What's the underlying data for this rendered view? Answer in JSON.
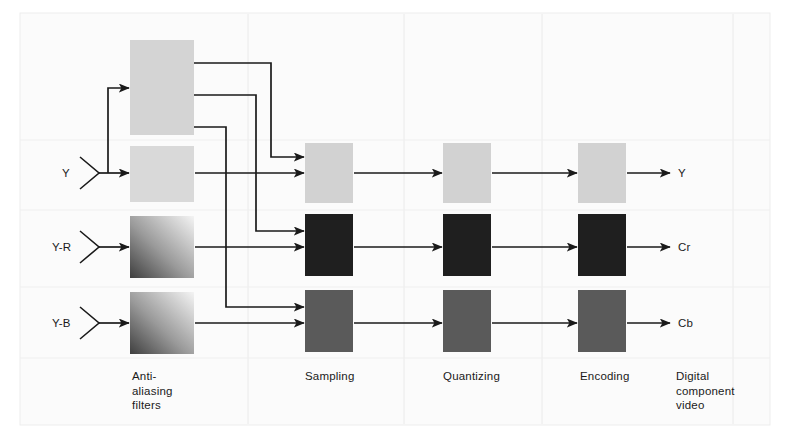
{
  "figure": {
    "background": "#ffffff",
    "panel_color": "#fbfbfb",
    "panel_border": "#ededed",
    "separator_color": "#eaeaea",
    "line_color": "#1a1a1a",
    "text_color": "#1a1a1a"
  },
  "inputs": [
    {
      "label": "Y",
      "x": 62,
      "y": 166
    },
    {
      "label": "Y-R",
      "x": 52,
      "y": 240
    },
    {
      "label": "Y-B",
      "x": 52,
      "y": 316
    }
  ],
  "outputs": [
    {
      "label": "Y",
      "x": 678,
      "y": 166
    },
    {
      "label": "Cr",
      "x": 678,
      "y": 240
    },
    {
      "label": "Cb",
      "x": 678,
      "y": 316
    }
  ],
  "columns": [
    {
      "name": "anti-aliasing-filters",
      "label": "Anti-\naliasing\nfilters",
      "x": 132,
      "y": 369
    },
    {
      "name": "sampling",
      "label": "Sampling",
      "x": 305,
      "y": 369
    },
    {
      "name": "quantizing",
      "label": "Quantizing",
      "x": 443,
      "y": 369
    },
    {
      "name": "encoding",
      "label": "Encoding",
      "x": 580,
      "y": 369
    },
    {
      "name": "digital-component-video",
      "label": "Digital\ncomponent\nvideo",
      "x": 676,
      "y": 369
    }
  ],
  "swatches": {
    "luma": "#d2d2d2",
    "chroma_r": "#1f1f1f",
    "chroma_b": "#5a5a5a",
    "gradient_dark": "#4a4a4a",
    "gradient_light": "#f2f2f2",
    "top_box": "#d4d4d4"
  },
  "blocks": [
    {
      "name": "filter-block-y-prefilter",
      "column": "anti-aliasing-filters",
      "row": "prefilter",
      "x": 130,
      "y": 40,
      "w": 64,
      "h": 95,
      "fill": "#d4d4d4",
      "style": "solid"
    },
    {
      "name": "filter-block-y",
      "column": "anti-aliasing-filters",
      "row": "y",
      "x": 130,
      "y": 146,
      "w": 64,
      "h": 56,
      "fill": "#d9d9d9",
      "style": "solid"
    },
    {
      "name": "filter-block-cr",
      "column": "anti-aliasing-filters",
      "row": "cr",
      "x": 130,
      "y": 216,
      "w": 64,
      "h": 62,
      "fill": "gradient",
      "style": "gradient"
    },
    {
      "name": "filter-block-cb",
      "column": "anti-aliasing-filters",
      "row": "cb",
      "x": 130,
      "y": 292,
      "w": 64,
      "h": 62,
      "fill": "gradient",
      "style": "gradient"
    },
    {
      "name": "sampling-block-y",
      "column": "sampling",
      "row": "y",
      "x": 305,
      "y": 143,
      "w": 48,
      "h": 60,
      "fill": "#d2d2d2",
      "style": "solid"
    },
    {
      "name": "sampling-block-cr",
      "column": "sampling",
      "row": "cr",
      "x": 305,
      "y": 214,
      "w": 48,
      "h": 62,
      "fill": "#1f1f1f",
      "style": "solid"
    },
    {
      "name": "sampling-block-cb",
      "column": "sampling",
      "row": "cb",
      "x": 305,
      "y": 290,
      "w": 48,
      "h": 62,
      "fill": "#5a5a5a",
      "style": "solid"
    },
    {
      "name": "quantizing-block-y",
      "column": "quantizing",
      "row": "y",
      "x": 443,
      "y": 143,
      "w": 48,
      "h": 60,
      "fill": "#d2d2d2",
      "style": "solid"
    },
    {
      "name": "quantizing-block-cr",
      "column": "quantizing",
      "row": "cr",
      "x": 443,
      "y": 214,
      "w": 48,
      "h": 62,
      "fill": "#1f1f1f",
      "style": "solid"
    },
    {
      "name": "quantizing-block-cb",
      "column": "quantizing",
      "row": "cb",
      "x": 443,
      "y": 290,
      "w": 48,
      "h": 62,
      "fill": "#5a5a5a",
      "style": "solid"
    },
    {
      "name": "encoding-block-y",
      "column": "encoding",
      "row": "y",
      "x": 578,
      "y": 143,
      "w": 48,
      "h": 60,
      "fill": "#d2d2d2",
      "style": "solid"
    },
    {
      "name": "encoding-block-cr",
      "column": "encoding",
      "row": "cr",
      "x": 578,
      "y": 214,
      "w": 48,
      "h": 62,
      "fill": "#1f1f1f",
      "style": "solid"
    },
    {
      "name": "encoding-block-cb",
      "column": "encoding",
      "row": "cb",
      "x": 578,
      "y": 290,
      "w": 48,
      "h": 62,
      "fill": "#5a5a5a",
      "style": "solid"
    }
  ],
  "separators": {
    "vertical_x": [
      248,
      404,
      542,
      733
    ],
    "vertical_y0": 14,
    "vertical_y1": 424,
    "horizontal_y": [
      140,
      210,
      287,
      358
    ],
    "horizontal_x0": 20,
    "horizontal_x1": 770
  },
  "panel": {
    "x": 20,
    "y": 13,
    "w": 750,
    "h": 412
  }
}
